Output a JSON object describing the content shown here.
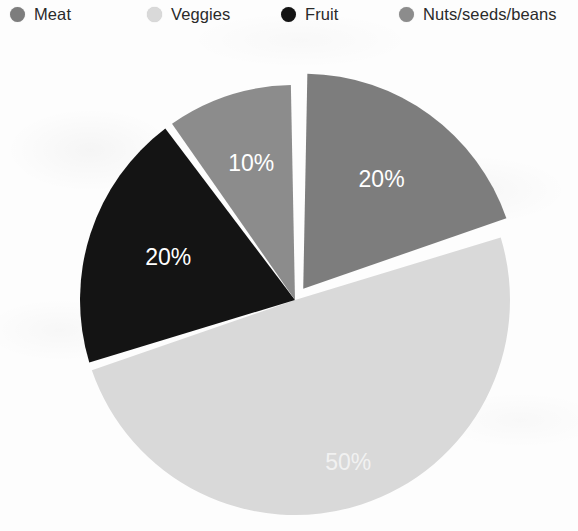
{
  "legend": {
    "items": [
      {
        "label": "Meat",
        "color": "#7d7d7d",
        "icon": "circle-swatch-icon",
        "x": 10,
        "text_x": 34
      },
      {
        "label": "Veggies",
        "color": "#d9d9d9",
        "icon": "circle-swatch-icon",
        "x": 147,
        "text_x": 171
      },
      {
        "label": "Fruit",
        "color": "#141414",
        "icon": "circle-swatch-icon",
        "x": 281,
        "text_x": 305
      },
      {
        "label": "Nuts/seeds/beans",
        "color": "#8c8c8c",
        "icon": "circle-swatch-icon",
        "x": 399,
        "text_x": 423
      }
    ]
  },
  "chart_data": {
    "type": "pie",
    "title": "",
    "subtitle": "",
    "xlabel": "",
    "ylabel": "",
    "legend_position": "top",
    "grid": false,
    "unit": "%",
    "center": {
      "x": 295,
      "y": 300
    },
    "radius": 215,
    "start_angle_deg": -90,
    "direction": "clockwise",
    "gap_deg": 2.2,
    "categories": [
      "Meat",
      "Veggies",
      "Fruit",
      "Nuts/seeds/beans"
    ],
    "values": [
      20,
      50,
      20,
      10
    ],
    "labels": [
      "20%",
      "50%",
      "20%",
      "10%"
    ],
    "colors": [
      "#7d7d7d",
      "#d9d9d9",
      "#141414",
      "#8c8c8c"
    ],
    "label_colors": [
      "#ffffff",
      "#f2f2f2",
      "#ffffff",
      "#ffffff"
    ],
    "exploded": [
      true,
      false,
      false,
      false
    ],
    "explode_offset_px": [
      14,
      0,
      0,
      0
    ],
    "slices": [
      {
        "name": "Meat",
        "value": 20,
        "label": "20%",
        "color": "#7d7d7d",
        "start_deg": -90,
        "end_deg": -18,
        "exploded": true,
        "offset": 14,
        "label_radius_frac": 0.62
      },
      {
        "name": "Veggies",
        "value": 50,
        "label": "50%",
        "color": "#d9d9d9",
        "start_deg": -18,
        "end_deg": 162,
        "exploded": false,
        "offset": 0,
        "label_radius_frac": 0.8
      },
      {
        "name": "Fruit",
        "value": 20,
        "label": "20%",
        "color": "#141414",
        "start_deg": 162,
        "end_deg": 234,
        "exploded": false,
        "offset": 0,
        "label_radius_frac": 0.62
      },
      {
        "name": "Nuts/seeds/beans",
        "value": 10,
        "label": "10%",
        "color": "#8c8c8c",
        "start_deg": 234,
        "end_deg": 270,
        "exploded": false,
        "offset": 0,
        "label_radius_frac": 0.66
      }
    ]
  }
}
